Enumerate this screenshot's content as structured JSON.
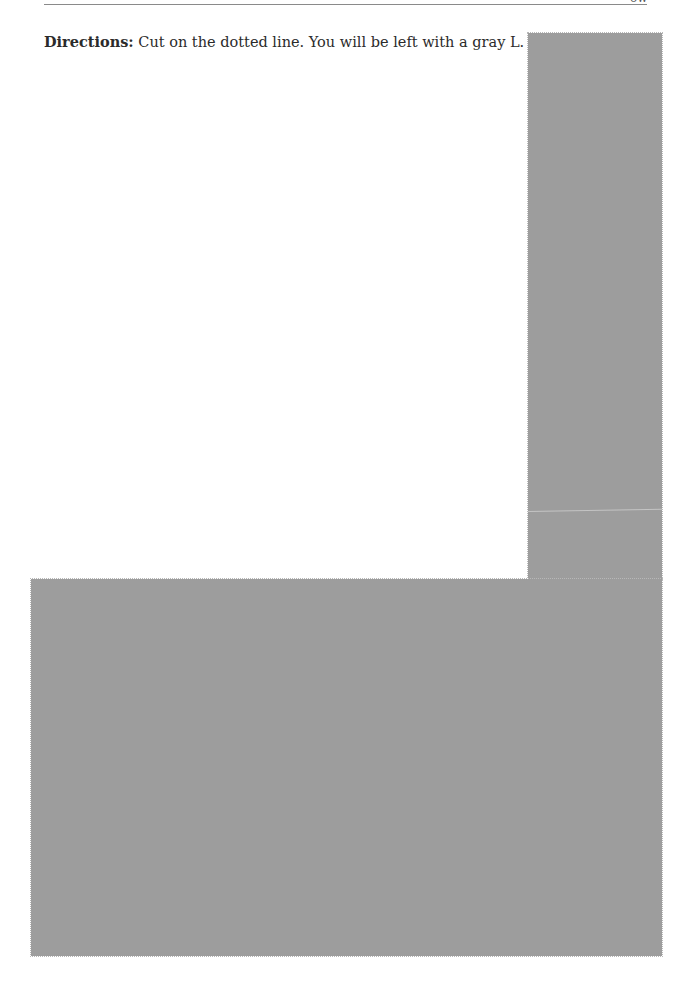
{
  "header": {
    "left_clipped_text": "",
    "right_clipped_text": "ow"
  },
  "directions": {
    "label": "Directions:",
    "text": " Cut on the dotted line. You will be left with a gray L."
  },
  "shape": {
    "name": "gray L",
    "fill_color": "#9d9d9d",
    "cut_line": "dotted"
  }
}
